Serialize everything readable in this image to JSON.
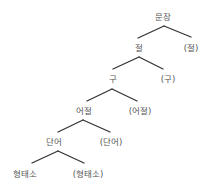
{
  "diagram": {
    "type": "tree",
    "line_color": "#333333",
    "text_color": "#555555",
    "nodes": [
      {
        "id": "n0",
        "label": "문장",
        "x": 163,
        "y": 17
      },
      {
        "id": "n1",
        "label": "절",
        "x": 139,
        "y": 48
      },
      {
        "id": "n2",
        "label": "(절)",
        "x": 191,
        "y": 48
      },
      {
        "id": "n3",
        "label": "구",
        "x": 113,
        "y": 79
      },
      {
        "id": "n4",
        "label": "(구)",
        "x": 168,
        "y": 79
      },
      {
        "id": "n5",
        "label": "어절",
        "x": 84,
        "y": 111
      },
      {
        "id": "n6",
        "label": "(어절)",
        "x": 140,
        "y": 111
      },
      {
        "id": "n7",
        "label": "단어",
        "x": 54,
        "y": 142
      },
      {
        "id": "n8",
        "label": "(단어)",
        "x": 111,
        "y": 142
      },
      {
        "id": "n9",
        "label": "형태소",
        "x": 25,
        "y": 174
      },
      {
        "id": "n10",
        "label": "(형태소)",
        "x": 88,
        "y": 174
      }
    ],
    "edges": [
      {
        "from": "n0",
        "to": "n1"
      },
      {
        "from": "n0",
        "to": "n2"
      },
      {
        "from": "n1",
        "to": "n3"
      },
      {
        "from": "n1",
        "to": "n4"
      },
      {
        "from": "n3",
        "to": "n5"
      },
      {
        "from": "n3",
        "to": "n6"
      },
      {
        "from": "n5",
        "to": "n7"
      },
      {
        "from": "n5",
        "to": "n8"
      },
      {
        "from": "n7",
        "to": "n9"
      },
      {
        "from": "n7",
        "to": "n10"
      }
    ]
  }
}
